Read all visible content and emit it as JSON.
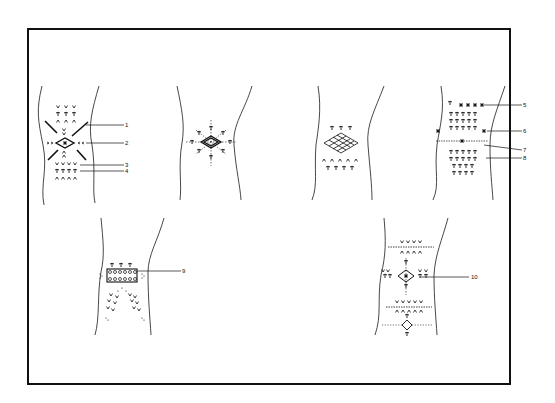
{
  "figure": {
    "stroke_color": "#111111",
    "background": "#ffffff",
    "panels": [
      {
        "id": "panel-1",
        "callouts": [
          "1",
          "2",
          "3",
          "4"
        ]
      },
      {
        "id": "panel-2",
        "callouts": []
      },
      {
        "id": "panel-3",
        "callouts": []
      },
      {
        "id": "panel-4",
        "callouts": [
          "5",
          "6",
          "7",
          "8"
        ]
      },
      {
        "id": "panel-5",
        "callouts": [
          "9"
        ]
      },
      {
        "id": "panel-6",
        "callouts": [
          "10"
        ]
      }
    ]
  },
  "labels": {
    "l1": "1",
    "l2": "2",
    "l3": "3",
    "l4": "4",
    "l5": "5",
    "l6": "6",
    "l7": "7",
    "l8": "8",
    "l9": "9",
    "l10": "10"
  }
}
